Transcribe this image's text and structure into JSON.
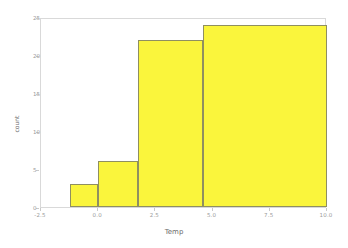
{
  "chart_data": {
    "type": "bar",
    "title": "",
    "subtitle": "",
    "xlabel": "Temp",
    "ylabel": "count",
    "xlim": [
      -2.5,
      10.0
    ],
    "ylim": [
      0,
      25
    ],
    "grid": false,
    "legend": null,
    "bar_color": "#faf53c",
    "bar_edge_color": "#8f8f60",
    "background_color": "#ffffff",
    "frame_color": "#d9d9d9",
    "tick_label_color": "#9a9a9a",
    "axis_title_color": "#6b6b6b",
    "xticks": [
      -2.5,
      0.0,
      2.5,
      5.0,
      7.5,
      10.0
    ],
    "xtick_labels": [
      "-2.5",
      "0.0",
      "2.5",
      "5.0",
      "7.5",
      "10.0"
    ],
    "yticks": [
      0,
      5,
      10,
      15,
      20,
      25
    ],
    "ytick_labels": [
      "0",
      "5",
      "10",
      "15",
      "20",
      "25"
    ],
    "bins": [
      {
        "label": "bin-1",
        "x_start": -1.25,
        "x_end": 0.0,
        "value": 3
      },
      {
        "label": "bin-2",
        "x_start": 0.0,
        "x_end": 1.75,
        "value": 6
      },
      {
        "label": "bin-3",
        "x_start": 1.75,
        "x_end": 4.6,
        "value": 22
      },
      {
        "label": "bin-4",
        "x_start": 4.6,
        "x_end": 10.0,
        "value": 24
      }
    ],
    "categories": [
      "-1.25 to 0.0",
      "0.0 to 1.75",
      "1.75 to 4.6",
      "4.6 to 10.0"
    ],
    "values": [
      3,
      6,
      22,
      24
    ]
  }
}
